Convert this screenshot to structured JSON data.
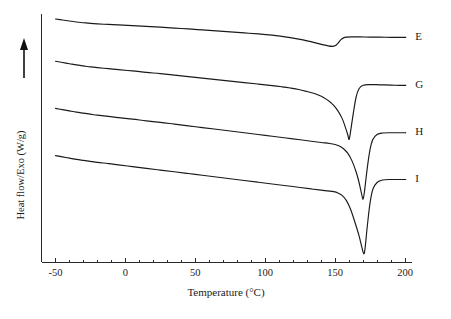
{
  "figure": {
    "type": "dsc-thermogram",
    "background_color": "#ffffff",
    "line_color": "#1a1a1a"
  },
  "chart_data": {
    "type": "line",
    "title": "",
    "subtitle": "",
    "xlabel": "Temperature (°C)",
    "ylabel": "Heat flow/Exo (W/g)",
    "ylabel_arrow": "up-arrow",
    "xlim": [
      -60,
      205
    ],
    "ylim": [
      0,
      100
    ],
    "xticks": [
      -50,
      0,
      50,
      100,
      150,
      200
    ],
    "xtick_labels": [
      "-50",
      "0",
      "50",
      "100",
      "150",
      "200"
    ],
    "xminor_tick_interval": 10,
    "yticks": [],
    "ytick_labels": [],
    "grid": false,
    "legend_position": "right-inline-labels",
    "y_axis_units_shown": false,
    "series": [
      {
        "name": "E",
        "label": "E",
        "peak_temperature_c": 148,
        "peak_depth_relative": 0.1,
        "label_x": 203,
        "x": [
          -50,
          -45,
          -40,
          -35,
          -30,
          -25,
          -20,
          -12,
          -5,
          5,
          15,
          25,
          35,
          45,
          55,
          65,
          75,
          85,
          95,
          105,
          112,
          118,
          124,
          130,
          136,
          141,
          145,
          148,
          150,
          152,
          154,
          156,
          158,
          162,
          168,
          175,
          182,
          190,
          196,
          200
        ],
        "y": [
          98.0,
          97.6,
          97.2,
          96.8,
          96.5,
          96.2,
          96.0,
          95.8,
          95.6,
          95.3,
          95.0,
          94.7,
          94.3,
          94.0,
          93.6,
          93.2,
          92.8,
          92.4,
          92.0,
          91.5,
          91.0,
          90.5,
          89.9,
          89.2,
          88.4,
          87.7,
          87.2,
          87.0,
          87.2,
          88.2,
          89.6,
          90.4,
          90.7,
          90.8,
          90.8,
          90.7,
          90.7,
          90.6,
          90.6,
          90.6
        ]
      },
      {
        "name": "G",
        "label": "G",
        "peak_temperature_c": 159,
        "peak_depth_relative": 0.38,
        "label_x": 203,
        "x": [
          -50,
          -45,
          -40,
          -35,
          -30,
          -25,
          -20,
          -12,
          -5,
          5,
          15,
          25,
          35,
          45,
          55,
          65,
          75,
          85,
          95,
          105,
          112,
          118,
          124,
          130,
          134,
          138,
          142,
          146,
          149,
          152,
          155,
          157,
          159,
          160,
          161,
          163,
          165,
          167,
          170,
          175,
          182,
          190,
          196,
          200
        ],
        "y": [
          81.0,
          80.5,
          80.0,
          79.5,
          79.1,
          78.7,
          78.4,
          78.0,
          77.6,
          77.1,
          76.5,
          76.0,
          75.4,
          74.8,
          74.2,
          73.6,
          73.0,
          72.4,
          71.8,
          71.2,
          70.7,
          70.2,
          69.6,
          68.8,
          68.2,
          67.4,
          66.3,
          64.8,
          63.2,
          61.0,
          58.0,
          55.0,
          51.5,
          49.5,
          52.5,
          60.0,
          66.5,
          69.8,
          71.3,
          71.6,
          71.5,
          71.4,
          71.3,
          71.3
        ]
      },
      {
        "name": "H",
        "label": "H",
        "peak_temperature_c": 170,
        "peak_depth_relative": 0.55,
        "label_x": 203,
        "x": [
          -50,
          -45,
          -40,
          -35,
          -30,
          -25,
          -20,
          -12,
          -5,
          5,
          15,
          25,
          35,
          45,
          55,
          65,
          75,
          85,
          95,
          105,
          115,
          125,
          133,
          140,
          146,
          150,
          153,
          156,
          159,
          162,
          165,
          167,
          169,
          170,
          171,
          173,
          175,
          177,
          180,
          184,
          190,
          196,
          200
        ],
        "y": [
          62.0,
          61.5,
          61.0,
          60.5,
          60.1,
          59.7,
          59.3,
          58.8,
          58.3,
          57.7,
          57.0,
          56.4,
          55.7,
          55.0,
          54.3,
          53.6,
          52.9,
          52.2,
          51.5,
          50.8,
          50.1,
          49.4,
          48.8,
          48.3,
          47.9,
          47.5,
          46.9,
          45.8,
          44.0,
          41.0,
          36.5,
          32.5,
          27.5,
          25.5,
          28.5,
          38.0,
          45.5,
          49.5,
          51.5,
          52.1,
          52.2,
          52.2,
          52.2
        ]
      },
      {
        "name": "I",
        "label": "I",
        "peak_temperature_c": 171,
        "peak_depth_relative": 0.78,
        "label_x": 203,
        "x": [
          -50,
          -45,
          -40,
          -35,
          -30,
          -25,
          -20,
          -12,
          -5,
          5,
          15,
          25,
          35,
          45,
          55,
          65,
          75,
          85,
          95,
          105,
          115,
          125,
          133,
          140,
          145,
          149,
          152,
          155,
          158,
          161,
          164,
          167,
          169,
          170.5,
          171.5,
          173,
          175,
          177,
          180,
          184,
          190,
          196,
          200
        ],
        "y": [
          43.0,
          42.5,
          42.0,
          41.5,
          41.1,
          40.7,
          40.3,
          39.8,
          39.3,
          38.6,
          37.9,
          37.2,
          36.5,
          35.8,
          35.1,
          34.4,
          33.7,
          33.0,
          32.3,
          31.6,
          30.9,
          30.2,
          29.6,
          29.1,
          28.8,
          28.5,
          28.0,
          27.0,
          25.0,
          21.5,
          16.5,
          11.0,
          6.5,
          3.5,
          6.0,
          14.5,
          24.0,
          29.5,
          32.2,
          33.2,
          33.4,
          33.4,
          33.4
        ]
      }
    ]
  },
  "labels": {
    "series_e": "E",
    "series_g": "G",
    "series_h": "H",
    "series_i": "I",
    "x_axis_title": "Temperature (°C)",
    "y_axis_title": "Heat flow/Exo (W/g)"
  }
}
